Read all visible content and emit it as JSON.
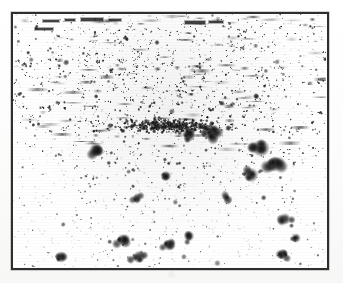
{
  "figure": {
    "kind": "autoradiograph-speckle-plate",
    "caption": "",
    "title": "",
    "background_color": "#ffffff",
    "paper_color": "#fdfdfc",
    "frame_color": "#2e2e2e",
    "speckle_color": "#1a1a1a",
    "frame": {
      "left": 11,
      "top": 12,
      "width": 318,
      "height": 258,
      "border_width": 2.5
    },
    "labels": [],
    "axis_ticks": [],
    "legend_entries": [],
    "annotations": []
  },
  "chart_data": {
    "type": "scatter",
    "title": "",
    "xlabel": "",
    "ylabel": "",
    "xlim": [
      0,
      313
    ],
    "ylim": [
      0,
      253
    ],
    "grid": false,
    "legend_position": "none",
    "density_bands": [
      {
        "y_from": 0,
        "y_to": 12,
        "density": 0.42,
        "mean_radius": 1.5,
        "note": "top streak band of short horizontal dashes"
      },
      {
        "y_from": 12,
        "y_to": 42,
        "density": 0.85,
        "mean_radius": 1.8,
        "note": "upper dense speckle"
      },
      {
        "y_from": 42,
        "y_to": 78,
        "density": 1.0,
        "mean_radius": 2.1,
        "note": "densest core band"
      },
      {
        "y_from": 78,
        "y_to": 120,
        "density": 0.92,
        "mean_radius": 2.3,
        "note": "dark mid band with coalesced blobs"
      },
      {
        "y_from": 120,
        "y_to": 150,
        "density": 0.55,
        "mean_radius": 2.2,
        "note": "transition, thinning"
      },
      {
        "y_from": 150,
        "y_to": 190,
        "density": 0.3,
        "mean_radius": 2.6,
        "note": "sparse scattered blobs"
      },
      {
        "y_from": 190,
        "y_to": 253,
        "density": 0.18,
        "mean_radius": 3.0,
        "note": "sparsest, large isolated blobs"
      }
    ],
    "major_blobs": [
      {
        "x": 248,
        "y": 134,
        "r": 9.0,
        "intensity": 0.95
      },
      {
        "x": 262,
        "y": 150,
        "r": 8.0,
        "intensity": 0.92
      },
      {
        "x": 238,
        "y": 161,
        "r": 7.5,
        "intensity": 0.9
      },
      {
        "x": 198,
        "y": 118,
        "r": 8.5,
        "intensity": 0.96
      },
      {
        "x": 176,
        "y": 121,
        "r": 7.0,
        "intensity": 0.94
      },
      {
        "x": 83,
        "y": 136,
        "r": 7.0,
        "intensity": 0.88
      },
      {
        "x": 110,
        "y": 226,
        "r": 6.5,
        "intensity": 0.86
      },
      {
        "x": 156,
        "y": 231,
        "r": 6.0,
        "intensity": 0.84
      },
      {
        "x": 176,
        "y": 222,
        "r": 5.5,
        "intensity": 0.82
      },
      {
        "x": 272,
        "y": 205,
        "r": 6.0,
        "intensity": 0.85
      },
      {
        "x": 283,
        "y": 224,
        "r": 5.0,
        "intensity": 0.8
      },
      {
        "x": 48,
        "y": 243,
        "r": 6.0,
        "intensity": 0.87
      },
      {
        "x": 126,
        "y": 243,
        "r": 6.5,
        "intensity": 0.88
      },
      {
        "x": 270,
        "y": 240,
        "r": 5.5,
        "intensity": 0.83
      },
      {
        "x": 215,
        "y": 186,
        "r": 5.0,
        "intensity": 0.78
      },
      {
        "x": 124,
        "y": 184,
        "r": 5.0,
        "intensity": 0.79
      },
      {
        "x": 153,
        "y": 162,
        "r": 5.5,
        "intensity": 0.81
      }
    ],
    "top_dashes": [
      {
        "x": 30,
        "y": 6,
        "w": 16,
        "h": 2
      },
      {
        "x": 52,
        "y": 5,
        "w": 10,
        "h": 2
      },
      {
        "x": 68,
        "y": 4,
        "w": 22,
        "h": 3
      },
      {
        "x": 96,
        "y": 5,
        "w": 12,
        "h": 2
      },
      {
        "x": 172,
        "y": 7,
        "w": 20,
        "h": 3
      },
      {
        "x": 196,
        "y": 7,
        "w": 14,
        "h": 2
      },
      {
        "x": 22,
        "y": 14,
        "w": 18,
        "h": 2
      }
    ]
  }
}
